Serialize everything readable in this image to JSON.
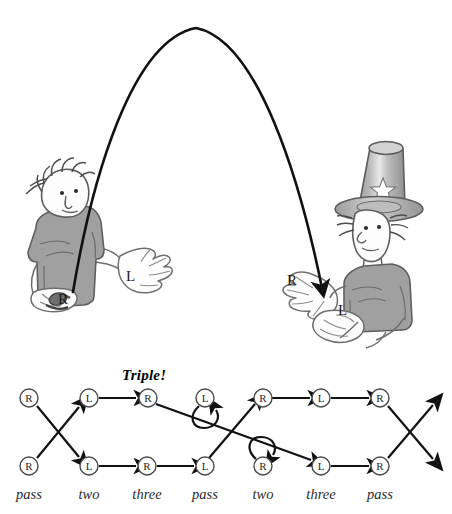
{
  "figure": {
    "type": "juggling-siteswap-diagram",
    "caption_note": "Two jugglers passing; ball arc from left juggler right hand to right juggler left hand",
    "arc": {
      "label": "ball-trajectory",
      "start": [
        73,
        292
      ],
      "peak": [
        196,
        28
      ],
      "end": [
        325,
        297
      ],
      "has_arrowhead_at_end": true,
      "color": "#111111"
    },
    "jugglers": [
      {
        "id": "left-juggler",
        "name": "wild-hair-juggler",
        "hat": false,
        "hand_labels": [
          {
            "text": "R",
            "x": 62,
            "y": 300
          },
          {
            "text": "L",
            "x": 129,
            "y": 277
          }
        ]
      },
      {
        "id": "right-juggler",
        "name": "top-hat-juggler",
        "hat": true,
        "hat_star": true,
        "hand_labels": [
          {
            "text": "R",
            "x": 290,
            "y": 280
          },
          {
            "text": "L",
            "x": 340,
            "y": 310
          }
        ]
      }
    ]
  },
  "diagram": {
    "name": "causal-diagram",
    "annotation": "Triple!",
    "annotation_pos": [
      123,
      371
    ],
    "columns": [
      {
        "index": 0,
        "x": 29,
        "label": "pass"
      },
      {
        "index": 1,
        "x": 89,
        "label": "two"
      },
      {
        "index": 2,
        "x": 148,
        "label": "three"
      },
      {
        "index": 3,
        "x": 205,
        "label": "pass"
      },
      {
        "index": 4,
        "x": 263,
        "label": "two"
      },
      {
        "index": 5,
        "x": 321,
        "label": "three"
      },
      {
        "index": 6,
        "x": 380,
        "label": "pass"
      }
    ],
    "rows": [
      {
        "index": 0,
        "name": "top-row",
        "y": 398
      },
      {
        "index": 1,
        "name": "bottom-row",
        "y": 466
      }
    ],
    "label_y": 494,
    "nodes": [
      {
        "id": "t0",
        "row": 0,
        "col": 0,
        "hand": "R"
      },
      {
        "id": "t1",
        "row": 0,
        "col": 1,
        "hand": "L"
      },
      {
        "id": "t2",
        "row": 0,
        "col": 2,
        "hand": "R"
      },
      {
        "id": "t3",
        "row": 0,
        "col": 3,
        "hand": "L"
      },
      {
        "id": "t4",
        "row": 0,
        "col": 4,
        "hand": "R"
      },
      {
        "id": "t5",
        "row": 0,
        "col": 5,
        "hand": "L"
      },
      {
        "id": "t6",
        "row": 0,
        "col": 6,
        "hand": "R"
      },
      {
        "id": "b0",
        "row": 1,
        "col": 0,
        "hand": "R"
      },
      {
        "id": "b1",
        "row": 1,
        "col": 1,
        "hand": "L"
      },
      {
        "id": "b2",
        "row": 1,
        "col": 2,
        "hand": "R"
      },
      {
        "id": "b3",
        "row": 1,
        "col": 3,
        "hand": "L"
      },
      {
        "id": "b4",
        "row": 1,
        "col": 4,
        "hand": "R"
      },
      {
        "id": "b5",
        "row": 1,
        "col": 5,
        "hand": "L"
      },
      {
        "id": "b6",
        "row": 1,
        "col": 6,
        "hand": "R"
      }
    ],
    "edges": [
      {
        "from": "t0",
        "to": "b1",
        "kind": "cross-down"
      },
      {
        "from": "b0",
        "to": "t1",
        "kind": "cross-up"
      },
      {
        "from": "t1",
        "to": "t2",
        "kind": "straight"
      },
      {
        "from": "b1",
        "to": "b2",
        "kind": "straight"
      },
      {
        "from": "b2",
        "to": "b3",
        "kind": "straight"
      },
      {
        "from": "t2",
        "to": "b5",
        "kind": "long-diagonal-down"
      },
      {
        "from": "b3",
        "to": "t4",
        "kind": "diagonal-up"
      },
      {
        "from": "t3",
        "to": "t3",
        "kind": "self-loop-below"
      },
      {
        "from": "b4",
        "to": "b4",
        "kind": "self-loop-above"
      },
      {
        "from": "t4",
        "to": "t5",
        "kind": "straight"
      },
      {
        "from": "t5",
        "to": "t6",
        "kind": "straight"
      },
      {
        "from": "b5",
        "to": "b6",
        "kind": "straight"
      },
      {
        "from": "t6",
        "to": "offpage-down",
        "kind": "cross-down-exit"
      },
      {
        "from": "b6",
        "to": "offpage-up",
        "kind": "cross-up-exit"
      }
    ],
    "node_radius": 9,
    "node_stroke": "#4a4a4a",
    "edge_color": "#111111"
  },
  "colors": {
    "ink": "#111111",
    "node_outline": "#4a4a4a",
    "shirt_gray": "#9c9c9c",
    "skin": "#fdfdfd",
    "hat_gray": "#a8a8a8",
    "background": "#ffffff"
  }
}
